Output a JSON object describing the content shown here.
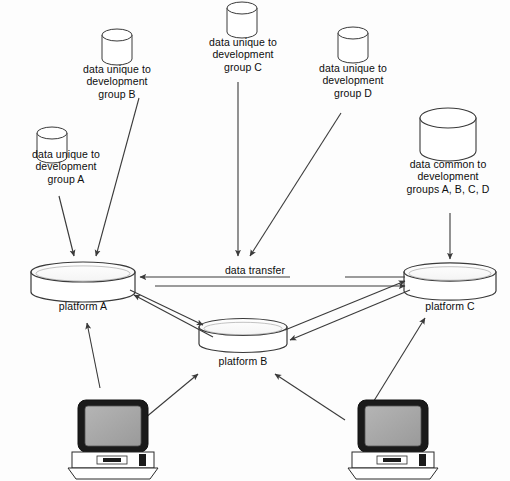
{
  "diagram": {
    "background_color": "#fdfdfd",
    "stroke_color": "#3a3a3a",
    "text_color": "#0d0d0d",
    "screen_fill_color": "#a8a8a8",
    "bezel_color": "#1a1a1a"
  },
  "source_databases": [
    {
      "id": "group-a",
      "label": "data unique to\ndevelopment\ngroup A",
      "icon": "database-cylinder-small"
    },
    {
      "id": "group-b",
      "label": "data unique to\ndevelopment\ngroup B",
      "icon": "database-cylinder-small"
    },
    {
      "id": "group-c",
      "label": "data unique to\ndevelopment\ngroup C",
      "icon": "database-cylinder-small"
    },
    {
      "id": "group-d",
      "label": "data unique to\ndevelopment\ngroup D",
      "icon": "database-cylinder-small"
    },
    {
      "id": "common",
      "label": "data common to\ndevelopment\ngroups A, B, C, D",
      "icon": "database-cylinder-large"
    }
  ],
  "platforms": [
    {
      "id": "platform-a",
      "label": "platform A",
      "icon": "disk-platter"
    },
    {
      "id": "platform-b",
      "label": "platform B",
      "icon": "disk-platter"
    },
    {
      "id": "platform-c",
      "label": "platform C",
      "icon": "disk-platter"
    }
  ],
  "workstations": [
    {
      "id": "workstation-left",
      "icon": "desktop-computer"
    },
    {
      "id": "workstation-right",
      "icon": "desktop-computer"
    }
  ],
  "connections": {
    "transfer_label": "data transfer"
  }
}
